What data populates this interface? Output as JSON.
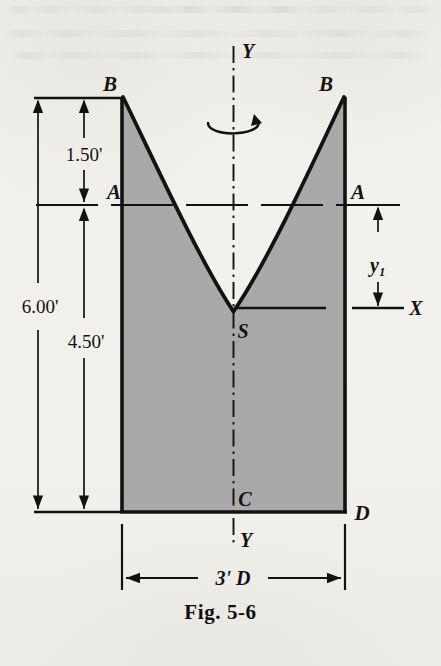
{
  "figure": {
    "caption": "Fig. 5-6",
    "kind": "engineering-cross-section-solid-of-revolution",
    "fill_color": "#a9a9a9",
    "line_color": "#141210",
    "paper_color": "#f2f0ec"
  },
  "axes": {
    "vertical_axis_top_label": "Y",
    "vertical_axis_bottom_label": "Y",
    "horizontal_axis_label": "X",
    "axis_style": "dash-dot centerline",
    "revolution_symbol": "rotation-arrow-about-Y"
  },
  "points": {
    "top_left": "B",
    "top_right": "B",
    "mid_left": "A",
    "mid_right": "A",
    "vertex": "S",
    "bottom_center": "C",
    "bottom_right": "D"
  },
  "dimensions": {
    "upper_left": "1.50'",
    "lower_left": "4.50'",
    "overall_left": "6.00'",
    "right_small": "y₁",
    "bottom_width": "3' D"
  },
  "geometry_values": {
    "total_height_ft": 6.0,
    "height_B_to_A_ft": 1.5,
    "height_A_to_base_ft": 4.5,
    "base_width_ft": 3.0,
    "curve_type": "parabola",
    "parabola_opens": "upward",
    "vertex_location": "on-Y-axis-at-S"
  }
}
